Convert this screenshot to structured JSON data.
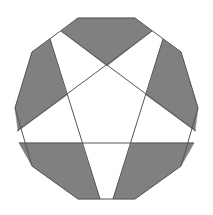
{
  "figure": {
    "colors": {
      "background": "#ffffff",
      "shade": "#808080",
      "stroke": "#555555"
    },
    "decagon": [
      [
        78,
        18
      ],
      [
        135,
        18
      ],
      [
        181,
        52
      ],
      [
        198,
        108
      ],
      [
        181,
        166
      ],
      [
        135,
        199
      ],
      [
        78,
        199
      ],
      [
        32,
        166
      ],
      [
        15,
        108
      ],
      [
        32,
        52
      ]
    ],
    "lines": [
      [
        [
          61,
          31
        ],
        [
          196,
          131
        ]
      ],
      [
        [
          152,
          31
        ],
        [
          17,
          131
        ]
      ],
      [
        [
          50,
          39
        ],
        [
          100,
          199
        ]
      ],
      [
        [
          163,
          39
        ],
        [
          113,
          199
        ]
      ],
      [
        [
          19,
          143
        ],
        [
          194,
          143
        ]
      ]
    ],
    "shaded_regions": [
      {
        "name": "top",
        "points": [
          [
            78,
            18
          ],
          [
            135,
            18
          ],
          [
            152,
            31
          ],
          [
            107,
            66
          ],
          [
            61,
            31
          ]
        ]
      },
      {
        "name": "left",
        "points": [
          [
            50,
            39
          ],
          [
            32,
            52
          ],
          [
            15,
            108
          ],
          [
            18,
            131
          ],
          [
            67,
            95
          ]
        ]
      },
      {
        "name": "right",
        "points": [
          [
            163,
            39
          ],
          [
            181,
            52
          ],
          [
            198,
            108
          ],
          [
            195,
            131
          ],
          [
            146,
            95
          ]
        ]
      },
      {
        "name": "bottom-left",
        "points": [
          [
            19,
            143
          ],
          [
            82,
            143
          ],
          [
            100,
            199
          ],
          [
            78,
            199
          ],
          [
            32,
            166
          ]
        ]
      },
      {
        "name": "bottom-right",
        "points": [
          [
            131,
            143
          ],
          [
            194,
            143
          ],
          [
            181,
            166
          ],
          [
            135,
            199
          ],
          [
            113,
            199
          ]
        ]
      }
    ]
  }
}
